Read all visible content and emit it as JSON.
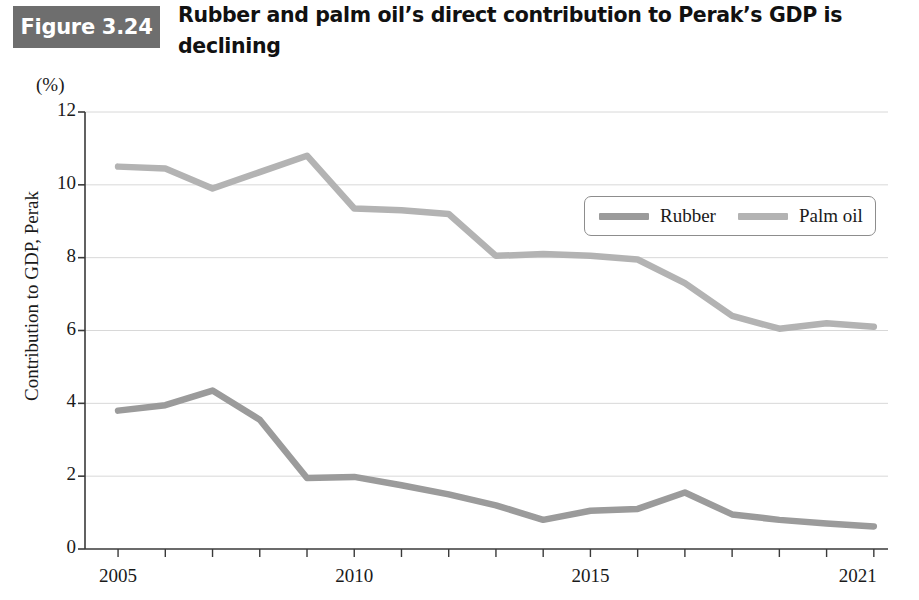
{
  "figure": {
    "badge_label": "Figure 3.24",
    "badge_color": "#6e6e6e",
    "title": "Rubber and palm oil’s direct contribution to Perak’s GDP is declining"
  },
  "chart_data": {
    "type": "line",
    "title": "Rubber and palm oil’s direct contribution to Perak’s GDP is declining",
    "unit_label": "(%)",
    "xlabel": "",
    "ylabel": "Contribution to GDP, Perak",
    "x": [
      2005,
      2006,
      2007,
      2008,
      2009,
      2010,
      2011,
      2012,
      2013,
      2014,
      2015,
      2016,
      2017,
      2018,
      2019,
      2020,
      2021
    ],
    "xtick_labels": [
      "2005",
      "2010",
      "2015",
      "2021"
    ],
    "xtick_values": [
      2005,
      2010,
      2015,
      2021
    ],
    "xlim": [
      2004.3,
      2021.3
    ],
    "ytick_labels": [
      "0",
      "2",
      "4",
      "6",
      "8",
      "10",
      "12"
    ],
    "ytick_values": [
      0,
      2,
      4,
      6,
      8,
      10,
      12
    ],
    "ylim": [
      0,
      12
    ],
    "grid": true,
    "legend_position": "top-right",
    "series": [
      {
        "name": "Rubber",
        "color": "#9b9b9b",
        "values": [
          3.8,
          3.95,
          4.35,
          3.55,
          1.95,
          1.98,
          1.75,
          1.5,
          1.2,
          0.8,
          1.05,
          1.1,
          1.55,
          0.95,
          0.8,
          0.7,
          0.62
        ]
      },
      {
        "name": "Palm oil",
        "color": "#b3b3b3",
        "values": [
          10.5,
          10.45,
          9.9,
          10.35,
          10.8,
          9.35,
          9.3,
          9.2,
          8.05,
          8.1,
          8.05,
          7.95,
          7.3,
          6.4,
          6.05,
          6.2,
          6.1
        ]
      }
    ]
  },
  "legend": {
    "items": [
      {
        "label": "Rubber",
        "color": "#9b9b9b"
      },
      {
        "label": "Palm oil",
        "color": "#b3b3b3"
      }
    ]
  }
}
